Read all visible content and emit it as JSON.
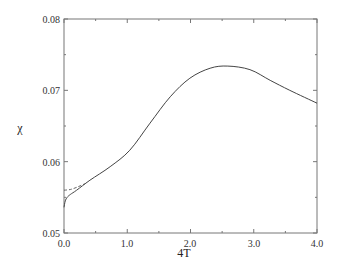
{
  "chart_data": {
    "type": "line",
    "title": "",
    "xlabel": "4T",
    "ylabel": "χ",
    "xlim": [
      0.0,
      4.0
    ],
    "ylim": [
      0.05,
      0.08
    ],
    "x_ticks": [
      "0.0",
      "1.0",
      "2.0",
      "3.0",
      "4.0"
    ],
    "y_ticks": [
      "0.05",
      "0.06",
      "0.07",
      "0.08"
    ],
    "grid": false,
    "legend": null,
    "series": [
      {
        "name": "solid",
        "style": "solid",
        "x": [
          0.0,
          0.02,
          0.05,
          0.1,
          0.2,
          0.41,
          0.73,
          1.04,
          1.36,
          1.68,
          1.99,
          2.31,
          2.59,
          2.94,
          3.26,
          3.57,
          4.0
        ],
        "y": [
          0.0536,
          0.0545,
          0.055,
          0.0554,
          0.056,
          0.0574,
          0.0593,
          0.0616,
          0.0654,
          0.0691,
          0.0717,
          0.0731,
          0.0734,
          0.0729,
          0.0714,
          0.07,
          0.0682
        ]
      },
      {
        "name": "dashed",
        "style": "dashed",
        "x": [
          0.0,
          0.1,
          0.2,
          0.33
        ],
        "y": [
          0.056,
          0.0561,
          0.0564,
          0.0569
        ]
      }
    ]
  },
  "labels": {
    "xlabel": "4T",
    "ylabel": "χ",
    "x_ticks": [
      "0.0",
      "1.0",
      "2.0",
      "3.0",
      "4.0"
    ],
    "y_ticks": [
      "0.05",
      "0.06",
      "0.07",
      "0.08"
    ]
  }
}
